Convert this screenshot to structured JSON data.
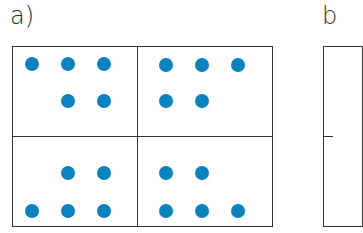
{
  "panels": [
    {
      "label": "a)"
    },
    {
      "label": "b"
    }
  ],
  "colors": {
    "dot": "#0a82be",
    "line": "#333333"
  },
  "panel_a": {
    "cells": [
      {
        "name": "top-left",
        "dots": 5,
        "pattern": "row1: 3, row2: 2 (right-aligned)"
      },
      {
        "name": "top-right",
        "dots": 5,
        "pattern": "row1: 3, row2: 2 (left-aligned)"
      },
      {
        "name": "bottom-left",
        "dots": 5,
        "pattern": "row1: 2 (right-aligned), row2: 3"
      },
      {
        "name": "bottom-right",
        "dots": 5,
        "pattern": "row1: 2 (left-aligned), row2: 3"
      }
    ]
  }
}
